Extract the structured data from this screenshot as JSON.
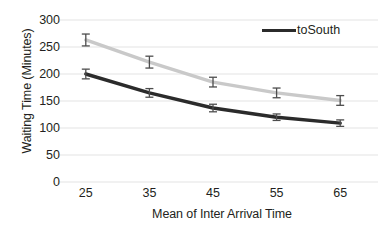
{
  "chart_data": {
    "type": "line",
    "title": "",
    "xlabel": "Mean of Inter Arrival Time",
    "ylabel": "Waiting Time (Minutes)",
    "categories": [
      "25",
      "35",
      "45",
      "55",
      "65"
    ],
    "x": [
      25,
      35,
      45,
      55,
      65
    ],
    "ylim": [
      0,
      300
    ],
    "yticks": [
      "0",
      "50",
      "100",
      "150",
      "200",
      "250",
      "300"
    ],
    "ytick_values": [
      0,
      50,
      100,
      150,
      200,
      250,
      300
    ],
    "grid": "horizontal",
    "legend_position": "top-right",
    "series": [
      {
        "name": "toNorth",
        "color": "#c9c9c9",
        "in_legend": false,
        "values": [
          263,
          222,
          185,
          165,
          151
        ],
        "error_upper": [
          11,
          11,
          9,
          9,
          9
        ],
        "error_lower": [
          11,
          11,
          9,
          9,
          9
        ]
      },
      {
        "name": "toSouth",
        "color": "#2b2b2b",
        "in_legend": true,
        "values": [
          200,
          165,
          137,
          120,
          109
        ],
        "error_upper": [
          9,
          8,
          7,
          6,
          6
        ],
        "error_lower": [
          9,
          8,
          7,
          6,
          6
        ]
      }
    ],
    "legend": [
      {
        "label": "toSouth",
        "color": "#2b2b2b"
      }
    ],
    "colors": {
      "background": "#ffffff",
      "grid": "#e3e3e3",
      "text": "#231f20",
      "series_light": "#c9c9c9",
      "series_dark": "#2b2b2b",
      "error_bar": "#4d4d4d"
    }
  }
}
